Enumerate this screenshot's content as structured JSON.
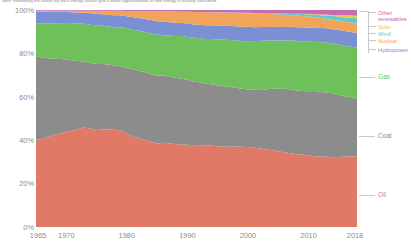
{
  "subtitle": "Note: Examining the shares by each energy source give a better approximation of how energy is actually consumed.",
  "legend": {
    "items": [
      {
        "key": "other_renewables",
        "label": "Other renewables",
        "color": "#c86bb0"
      },
      {
        "key": "solar",
        "label": "Solar",
        "color": "#e8c84a"
      },
      {
        "key": "wind",
        "label": "Wind",
        "color": "#64c8c8"
      },
      {
        "key": "nuclear",
        "label": "Nuclear",
        "color": "#f0a55a"
      },
      {
        "key": "hydropower",
        "label": "Hydropower",
        "color": "#7b8fd4"
      },
      {
        "key": "gas",
        "label": "Gas",
        "color": "#6fbf5a"
      },
      {
        "key": "coal",
        "label": "Coal",
        "color": "#8c8c8c"
      },
      {
        "key": "oil",
        "label": "Oil",
        "color": "#e07a66"
      }
    ]
  },
  "chart_data": {
    "type": "area",
    "title": "",
    "subtitle": "Note: Examining the shares by each energy source give a better approximation of how energy is actually consumed.",
    "xlabel": "",
    "ylabel": "",
    "stacked": true,
    "normalized": true,
    "grid": false,
    "legend_position": "right",
    "xlim": [
      1965,
      2018
    ],
    "ylim": [
      0,
      100
    ],
    "ytick_labels": [
      "0%",
      "20%",
      "40%",
      "60%",
      "80%",
      "100%"
    ],
    "yticks": [
      0,
      20,
      40,
      60,
      80,
      100
    ],
    "xtick_labels": [
      "1965",
      "1970",
      "1980",
      "1990",
      "2000",
      "2010",
      "2018"
    ],
    "xticks": [
      1965,
      1970,
      1980,
      1990,
      2000,
      2010,
      2018
    ],
    "x": [
      1965,
      1966,
      1967,
      1968,
      1969,
      1970,
      1971,
      1972,
      1973,
      1974,
      1975,
      1976,
      1977,
      1978,
      1979,
      1980,
      1981,
      1982,
      1983,
      1984,
      1985,
      1986,
      1987,
      1988,
      1989,
      1990,
      1991,
      1992,
      1993,
      1994,
      1995,
      1996,
      1997,
      1998,
      1999,
      2000,
      2001,
      2002,
      2003,
      2004,
      2005,
      2006,
      2007,
      2008,
      2009,
      2010,
      2011,
      2012,
      2013,
      2014,
      2015,
      2016,
      2017,
      2018
    ],
    "series": [
      {
        "name": "Oil",
        "color": "#e07a66",
        "values": [
          40.0,
          40.8,
          41.6,
          42.5,
          43.2,
          44.0,
          44.6,
          45.2,
          46.0,
          45.5,
          44.8,
          45.3,
          45.4,
          45.3,
          45.0,
          43.4,
          42.0,
          41.0,
          40.2,
          39.6,
          38.8,
          39.2,
          39.0,
          38.8,
          38.6,
          38.4,
          38.2,
          38.2,
          38.0,
          37.8,
          37.6,
          37.4,
          37.3,
          37.3,
          37.2,
          36.9,
          36.6,
          36.2,
          35.9,
          35.7,
          35.3,
          34.9,
          34.5,
          34.0,
          33.8,
          33.4,
          33.2,
          33.0,
          32.9,
          32.8,
          32.9,
          33.0,
          33.1,
          33.1
        ]
      },
      {
        "name": "Coal",
        "color": "#8c8c8c",
        "values": [
          38.5,
          37.6,
          36.3,
          35.3,
          34.4,
          33.3,
          32.3,
          31.4,
          30.4,
          30.2,
          30.4,
          30.2,
          30.2,
          29.9,
          29.9,
          30.5,
          30.9,
          31.2,
          31.4,
          31.3,
          31.5,
          31.2,
          31.2,
          31.0,
          30.8,
          30.4,
          29.8,
          29.1,
          28.7,
          28.5,
          28.3,
          28.2,
          27.9,
          27.2,
          26.8,
          26.6,
          26.6,
          26.9,
          27.9,
          28.4,
          29.0,
          29.5,
          29.9,
          29.9,
          29.6,
          30.0,
          30.5,
          30.3,
          30.2,
          30.0,
          29.2,
          28.3,
          27.7,
          27.2
        ]
      },
      {
        "name": "Gas",
        "color": "#6fbf5a",
        "values": [
          15.3,
          15.6,
          16.0,
          16.3,
          16.6,
          16.9,
          17.2,
          17.5,
          17.5,
          17.7,
          17.7,
          17.7,
          17.7,
          17.9,
          18.3,
          18.4,
          18.5,
          18.5,
          18.4,
          19.0,
          19.1,
          18.8,
          19.2,
          19.5,
          19.9,
          20.0,
          20.5,
          20.6,
          20.9,
          21.0,
          21.3,
          21.6,
          21.7,
          21.9,
          22.1,
          22.3,
          22.4,
          22.6,
          22.5,
          22.4,
          22.5,
          22.6,
          22.9,
          23.2,
          23.1,
          23.2,
          23.2,
          23.4,
          23.4,
          23.5,
          23.5,
          23.6,
          23.7,
          23.9
        ]
      },
      {
        "name": "Hydropower",
        "color": "#7b8fd4",
        "values": [
          5.6,
          5.5,
          5.4,
          5.3,
          5.2,
          5.1,
          5.1,
          5.0,
          5.0,
          5.3,
          5.4,
          5.3,
          5.4,
          5.5,
          5.5,
          5.6,
          5.7,
          5.9,
          6.1,
          6.2,
          6.2,
          6.3,
          6.2,
          6.2,
          6.1,
          6.3,
          6.3,
          6.2,
          6.4,
          6.4,
          6.5,
          6.5,
          6.5,
          6.6,
          6.6,
          6.6,
          6.4,
          6.4,
          6.3,
          6.3,
          6.3,
          6.3,
          6.3,
          6.4,
          6.6,
          6.5,
          6.5,
          6.6,
          6.7,
          6.8,
          6.8,
          6.9,
          6.9,
          6.8
        ]
      },
      {
        "name": "Nuclear",
        "color": "#f0a55a",
        "values": [
          0.2,
          0.3,
          0.4,
          0.5,
          0.5,
          0.5,
          0.6,
          0.7,
          0.9,
          1.1,
          1.4,
          1.6,
          1.9,
          2.1,
          2.1,
          2.4,
          2.9,
          3.2,
          3.6,
          4.1,
          4.6,
          4.8,
          5.0,
          5.2,
          5.3,
          5.5,
          5.8,
          5.9,
          6.0,
          6.0,
          6.1,
          6.2,
          6.1,
          6.2,
          6.3,
          6.3,
          6.3,
          6.2,
          6.0,
          5.9,
          5.8,
          5.7,
          5.5,
          5.4,
          5.3,
          5.2,
          4.9,
          4.6,
          4.4,
          4.4,
          4.4,
          4.4,
          4.4,
          4.4
        ]
      },
      {
        "name": "Wind",
        "color": "#64c8c8",
        "values": [
          0,
          0,
          0,
          0,
          0,
          0,
          0,
          0,
          0,
          0,
          0,
          0,
          0,
          0,
          0,
          0,
          0,
          0,
          0,
          0,
          0.01,
          0.01,
          0.01,
          0.02,
          0.02,
          0.03,
          0.03,
          0.04,
          0.05,
          0.06,
          0.07,
          0.08,
          0.1,
          0.12,
          0.15,
          0.18,
          0.22,
          0.26,
          0.31,
          0.37,
          0.44,
          0.52,
          0.62,
          0.74,
          0.88,
          1.02,
          1.19,
          1.37,
          1.55,
          1.74,
          1.93,
          2.1,
          2.28,
          2.45
        ]
      },
      {
        "name": "Solar",
        "color": "#e8c84a",
        "values": [
          0,
          0,
          0,
          0,
          0,
          0,
          0,
          0,
          0,
          0,
          0,
          0,
          0,
          0,
          0,
          0,
          0,
          0,
          0,
          0,
          0,
          0,
          0,
          0,
          0,
          0,
          0,
          0,
          0,
          0,
          0,
          0,
          0.01,
          0.01,
          0.01,
          0.01,
          0.01,
          0.02,
          0.02,
          0.03,
          0.04,
          0.05,
          0.07,
          0.09,
          0.12,
          0.17,
          0.24,
          0.33,
          0.44,
          0.56,
          0.7,
          0.85,
          1.02,
          1.2
        ]
      },
      {
        "name": "Other renewables",
        "color": "#c86bb0",
        "values": [
          0.4,
          0.4,
          0.4,
          0.4,
          0.4,
          0.4,
          0.4,
          0.4,
          0.4,
          0.4,
          0.4,
          0.4,
          0.4,
          0.4,
          0.4,
          0.5,
          0.5,
          0.5,
          0.5,
          0.6,
          0.6,
          0.6,
          0.7,
          0.7,
          0.8,
          0.8,
          0.9,
          0.9,
          1.0,
          1.0,
          1.1,
          1.1,
          1.2,
          1.2,
          1.3,
          1.3,
          1.4,
          1.4,
          1.5,
          1.5,
          1.6,
          1.6,
          1.7,
          1.8,
          1.8,
          1.9,
          2.0,
          2.1,
          2.2,
          2.3,
          2.4,
          2.5,
          2.6,
          2.7
        ]
      }
    ]
  }
}
